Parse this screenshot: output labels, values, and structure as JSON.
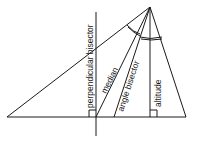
{
  "diagram": {
    "labels": {
      "perpendicular_bisector": "perpendicular bisector",
      "median": "median",
      "angle_bisector": "angle bisector",
      "altitude": "altitude"
    },
    "vertices": {
      "apex": [
        150,
        7
      ],
      "left": [
        7,
        117
      ],
      "right": [
        186,
        117
      ]
    },
    "colors": {
      "stroke": "#1a1a1a",
      "background": "#ffffff"
    }
  }
}
